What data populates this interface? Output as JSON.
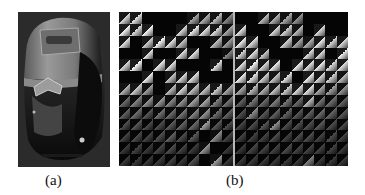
{
  "figure": {
    "panels": [
      {
        "id": "a",
        "caption": "(a)",
        "content": "grayscale photo of a handheld device (colorimeter-like) with display window and grip"
      },
      {
        "id": "b",
        "caption": "(b)",
        "content": "two side-by-side grids of triangular-split cells with varying brightness"
      }
    ]
  },
  "grids": {
    "rows": 13,
    "cols": 10,
    "left": [
      [
        200,
        210,
        0,
        0,
        0,
        0,
        150,
        160,
        170,
        120
      ],
      [
        230,
        200,
        230,
        0,
        0,
        200,
        220,
        210,
        200,
        150
      ],
      [
        210,
        0,
        190,
        230,
        210,
        180,
        0,
        0,
        170,
        140
      ],
      [
        0,
        0,
        220,
        0,
        0,
        200,
        210,
        0,
        0,
        120
      ],
      [
        200,
        230,
        0,
        210,
        210,
        0,
        0,
        0,
        210,
        0
      ],
      [
        0,
        0,
        220,
        0,
        180,
        200,
        200,
        0,
        0,
        0
      ],
      [
        160,
        180,
        140,
        0,
        170,
        200,
        170,
        180,
        190,
        150
      ],
      [
        90,
        110,
        130,
        140,
        120,
        130,
        140,
        150,
        110,
        100
      ],
      [
        80,
        90,
        70,
        100,
        90,
        100,
        120,
        130,
        90,
        80
      ],
      [
        60,
        70,
        60,
        60,
        70,
        80,
        90,
        140,
        70,
        60
      ],
      [
        50,
        60,
        50,
        60,
        80,
        60,
        70,
        0,
        120,
        50
      ],
      [
        40,
        50,
        40,
        50,
        60,
        50,
        40,
        130,
        0,
        40
      ],
      [
        40,
        40,
        40,
        40,
        50,
        40,
        60,
        0,
        140,
        40
      ]
    ],
    "right": [
      [
        0,
        0,
        170,
        160,
        150,
        130,
        0,
        0,
        0,
        0
      ],
      [
        210,
        0,
        0,
        200,
        190,
        170,
        0,
        200,
        0,
        0
      ],
      [
        220,
        200,
        0,
        0,
        190,
        150,
        160,
        220,
        200,
        200
      ],
      [
        200,
        210,
        190,
        0,
        0,
        0,
        200,
        210,
        0,
        220
      ],
      [
        210,
        230,
        200,
        220,
        0,
        220,
        210,
        220,
        200,
        210
      ],
      [
        220,
        210,
        190,
        180,
        210,
        0,
        220,
        200,
        190,
        170
      ],
      [
        150,
        170,
        160,
        180,
        190,
        200,
        210,
        150,
        140,
        130
      ],
      [
        80,
        100,
        90,
        110,
        100,
        90,
        170,
        100,
        90,
        80
      ],
      [
        60,
        120,
        70,
        80,
        80,
        70,
        80,
        90,
        80,
        70
      ],
      [
        50,
        60,
        70,
        130,
        60,
        60,
        60,
        70,
        60,
        60
      ],
      [
        50,
        50,
        50,
        60,
        50,
        60,
        60,
        50,
        60,
        50
      ],
      [
        40,
        50,
        50,
        50,
        60,
        50,
        50,
        50,
        50,
        40
      ],
      [
        40,
        40,
        40,
        40,
        40,
        40,
        110,
        40,
        40,
        40
      ]
    ]
  }
}
